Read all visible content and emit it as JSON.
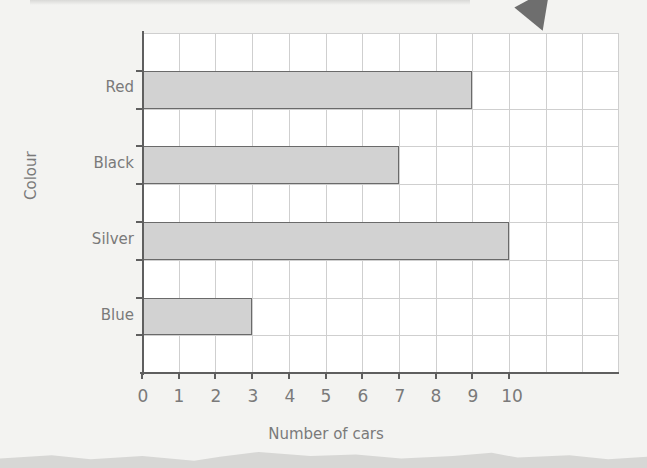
{
  "chart_data": {
    "type": "bar",
    "orientation": "horizontal",
    "title": "",
    "xlabel": "Number of cars",
    "ylabel": "Colour",
    "categories": [
      "Red",
      "Black",
      "Silver",
      "Blue"
    ],
    "values": [
      9,
      7,
      10,
      3
    ],
    "xlim": [
      0,
      13
    ],
    "x_tick_labels": [
      "0",
      "1",
      "2",
      "3",
      "4",
      "5",
      "6",
      "7",
      "8",
      "9",
      "10"
    ],
    "grid": true,
    "bar_color": "#d2d2d2",
    "bar_edge_color": "#6a6a6a",
    "grid_color": "#cfcfcf",
    "legend": null
  },
  "labels": {
    "x_axis_title": "Number of cars",
    "y_axis_title": "Colour",
    "categories": [
      "Red",
      "Black",
      "Silver",
      "Blue"
    ],
    "x_ticks": [
      "0",
      "1",
      "2",
      "3",
      "4",
      "5",
      "6",
      "7",
      "8",
      "9",
      "10"
    ]
  }
}
